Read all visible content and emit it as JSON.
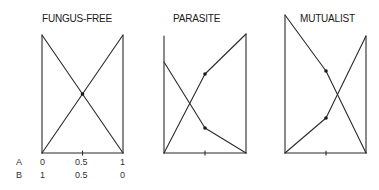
{
  "panels": [
    {
      "title": "FUNGUS-FREE",
      "line_a": [
        [
          0,
          0
        ],
        [
          0.5,
          0.5
        ],
        [
          1,
          1
        ]
      ],
      "line_b": [
        [
          0,
          1
        ],
        [
          0.5,
          0.5
        ],
        [
          1,
          0
        ]
      ],
      "marked_points": [
        [
          0.5,
          0.5
        ]
      ]
    },
    {
      "title": "PARASITE",
      "line_rising": [
        [
          0,
          0
        ],
        [
          0.5,
          0.67
        ],
        [
          1,
          1
        ]
      ],
      "line_falling": [
        [
          0,
          0.78
        ],
        [
          0.5,
          0.21
        ],
        [
          1,
          0
        ]
      ],
      "marked_points": [
        [
          0.5,
          0.67
        ],
        [
          0.5,
          0.21
        ]
      ]
    },
    {
      "title": "MUTUALIST",
      "line_rising": [
        [
          0,
          0
        ],
        [
          0.5,
          0.25
        ],
        [
          1,
          0.85
        ]
      ],
      "line_falling": [
        [
          0,
          1.0
        ],
        [
          0.5,
          0.6
        ],
        [
          1,
          0
        ]
      ],
      "marked_points": [
        [
          0.5,
          0.6
        ],
        [
          0.5,
          0.25
        ]
      ]
    }
  ],
  "x_axis": {
    "row_a": {
      "label": "A",
      "ticks": [
        "0",
        "0.5",
        "1"
      ]
    },
    "row_b": {
      "label": "B",
      "ticks": [
        "1",
        "0.5",
        "0"
      ]
    }
  }
}
